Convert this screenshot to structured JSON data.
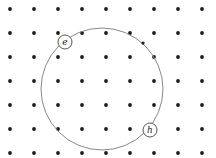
{
  "diagram": {
    "type": "lattice-with-circle",
    "grid": {
      "x_positions": [
        10,
        34,
        58,
        82,
        106,
        130,
        154,
        178,
        202
      ],
      "y_positions": [
        9,
        33,
        57,
        81,
        105,
        129,
        153
      ],
      "dot_radius": 1.9,
      "dot_color": "#1a1a1a"
    },
    "big_circle": {
      "cx": 102,
      "cy": 89,
      "r": 61,
      "stroke": "#888888"
    },
    "arc_dot": {
      "cx": 143,
      "cy": 43
    },
    "labels": [
      {
        "text": "e",
        "cx": 65,
        "cy": 42,
        "r": 7
      },
      {
        "text": "h",
        "cx": 150,
        "cy": 130,
        "r": 7
      }
    ]
  }
}
